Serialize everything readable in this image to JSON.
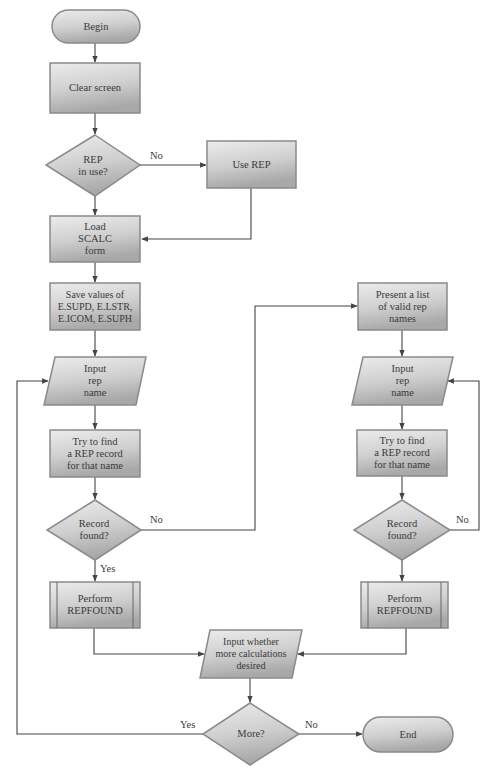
{
  "diagram": {
    "type": "flowchart",
    "nodes": {
      "begin": {
        "shape": "terminator",
        "lines": [
          "Begin"
        ]
      },
      "clear_screen": {
        "shape": "process",
        "lines": [
          "Clear screen"
        ]
      },
      "rep_in_use": {
        "shape": "decision",
        "lines": [
          "REP",
          "in use?"
        ]
      },
      "use_rep": {
        "shape": "process",
        "lines": [
          "Use REP"
        ]
      },
      "load_form": {
        "shape": "process",
        "lines": [
          "Load",
          "SCALC",
          "form"
        ]
      },
      "save_values": {
        "shape": "process",
        "lines": [
          "Save values of",
          "E.SUPD, E.LSTR,",
          "E.ICOM, E.SUPH"
        ]
      },
      "input_rep_left": {
        "shape": "input-output",
        "lines": [
          "Input",
          "rep",
          "name"
        ]
      },
      "try_find_left": {
        "shape": "process",
        "lines": [
          "Try to find",
          "a REP record",
          "for that name"
        ]
      },
      "record_found_left": {
        "shape": "decision",
        "lines": [
          "Record",
          "found?"
        ]
      },
      "perform_left": {
        "shape": "predefined-process",
        "lines": [
          "Perform",
          "REPFOUND"
        ]
      },
      "present_list": {
        "shape": "process",
        "lines": [
          "Present a list",
          "of valid rep",
          "names"
        ]
      },
      "input_rep_right": {
        "shape": "input-output",
        "lines": [
          "Input",
          "rep",
          "name"
        ]
      },
      "try_find_right": {
        "shape": "process",
        "lines": [
          "Try to find",
          "a REP record",
          "for that name"
        ]
      },
      "record_found_right": {
        "shape": "decision",
        "lines": [
          "Record",
          "found?"
        ]
      },
      "perform_right": {
        "shape": "predefined-process",
        "lines": [
          "Perform",
          "REPFOUND"
        ]
      },
      "input_more": {
        "shape": "input-output",
        "lines": [
          "Input whether",
          "more calculations",
          "desired"
        ]
      },
      "more": {
        "shape": "decision",
        "lines": [
          "More?"
        ]
      },
      "end": {
        "shape": "terminator",
        "lines": [
          "End"
        ]
      }
    },
    "edge_labels": {
      "rep_in_use_no": "No",
      "record_found_left_no": "No",
      "record_found_left_yes": "Yes",
      "record_found_right_no": "No",
      "more_yes": "Yes",
      "more_no": "No"
    },
    "edges": [
      {
        "from": "begin",
        "to": "clear_screen"
      },
      {
        "from": "clear_screen",
        "to": "rep_in_use"
      },
      {
        "from": "rep_in_use",
        "to": "use_rep",
        "label": "No"
      },
      {
        "from": "rep_in_use",
        "to": "load_form"
      },
      {
        "from": "use_rep",
        "to": "load_form"
      },
      {
        "from": "load_form",
        "to": "save_values"
      },
      {
        "from": "save_values",
        "to": "input_rep_left"
      },
      {
        "from": "input_rep_left",
        "to": "try_find_left"
      },
      {
        "from": "try_find_left",
        "to": "record_found_left"
      },
      {
        "from": "record_found_left",
        "to": "perform_left",
        "label": "Yes"
      },
      {
        "from": "record_found_left",
        "to": "present_list",
        "label": "No"
      },
      {
        "from": "present_list",
        "to": "input_rep_right"
      },
      {
        "from": "input_rep_right",
        "to": "try_find_right"
      },
      {
        "from": "try_find_right",
        "to": "record_found_right"
      },
      {
        "from": "record_found_right",
        "to": "perform_right"
      },
      {
        "from": "record_found_right",
        "to": "input_rep_right",
        "label": "No"
      },
      {
        "from": "perform_left",
        "to": "input_more"
      },
      {
        "from": "perform_right",
        "to": "input_more"
      },
      {
        "from": "input_more",
        "to": "more"
      },
      {
        "from": "more",
        "to": "input_rep_left",
        "label": "Yes"
      },
      {
        "from": "more",
        "to": "end",
        "label": "No"
      }
    ],
    "colors": {
      "shape_fill_light": "#e4e4e4",
      "shape_fill_dark": "#a9a9a9",
      "shape_border": "#8a8a8a",
      "line": "#444444",
      "text": "#3a3a3a"
    }
  }
}
